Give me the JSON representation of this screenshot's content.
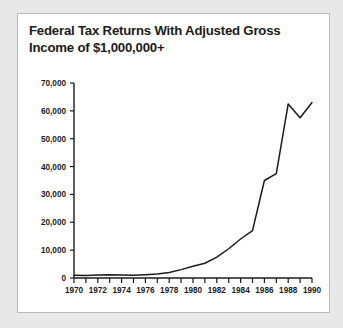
{
  "chart_data": {
    "type": "line",
    "title": "Federal Tax Returns With Adjusted Gross Income of $1,000,000+",
    "title_line1": "Federal Tax Returns With Adjusted Gross",
    "title_line2": "Income of $1,000,000+",
    "xlabel": "",
    "ylabel": "",
    "x": [
      1970,
      1971,
      1972,
      1973,
      1974,
      1975,
      1976,
      1977,
      1978,
      1979,
      1980,
      1981,
      1982,
      1983,
      1984,
      1985,
      1986,
      1987,
      1988,
      1989,
      1990
    ],
    "values": [
      1000,
      900,
      1100,
      1200,
      1100,
      1000,
      1200,
      1400,
      2000,
      3000,
      4200,
      5300,
      7500,
      10500,
      14000,
      17000,
      35000,
      37500,
      62500,
      57500,
      63000
    ],
    "series": [
      {
        "name": "Returns with AGI of $1,000,000+",
        "values": [
          1000,
          900,
          1100,
          1200,
          1100,
          1000,
          1200,
          1400,
          2000,
          3000,
          4200,
          5300,
          7500,
          10500,
          14000,
          17000,
          35000,
          37500,
          62500,
          57500,
          63000
        ]
      }
    ],
    "xlim": [
      1970,
      1990
    ],
    "ylim": [
      0,
      70000
    ],
    "ytick_values": [
      0,
      10000,
      20000,
      30000,
      40000,
      50000,
      60000,
      70000
    ],
    "ytick_labels": [
      "0",
      "10,000",
      "20,000",
      "30,000",
      "40,000",
      "50,000",
      "60,000",
      "70,000"
    ],
    "xtick_values": [
      1970,
      1971,
      1972,
      1973,
      1974,
      1975,
      1976,
      1977,
      1978,
      1979,
      1980,
      1981,
      1982,
      1983,
      1984,
      1985,
      1986,
      1987,
      1988,
      1989,
      1990
    ],
    "xtick_labels_shown": [
      "1970",
      "1972",
      "1974",
      "1976",
      "1978",
      "1980",
      "1982",
      "1984",
      "1986",
      "1988",
      "1990"
    ],
    "xtick_label_step": 2,
    "grid": false,
    "legend": false,
    "legend_position": "none",
    "line_color": "#1b1b1b",
    "background_color": "#ffffff",
    "page_background_color": "#e8e8e8",
    "border_color": "#b9b9b9"
  }
}
